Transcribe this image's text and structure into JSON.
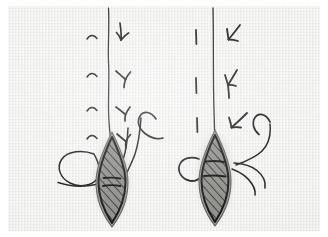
{
  "document": {
    "kind": "scanned-hand-drawn-diagram",
    "medium": "ink on textured paper",
    "paper_color": "#ececeb",
    "ink_color": "#1d1d1d",
    "scan_margin_color": "#ffffff",
    "caption": "",
    "title": "",
    "labels": []
  },
  "figures": [
    {
      "id": "figure-left",
      "name": "left-specimen",
      "label": "",
      "axis": {
        "name": "central-stem-line",
        "description": "long wavy vertical ink line running from top edge down into the hatched body"
      },
      "tick_marks": {
        "left_side": {
          "glyph": "small-arc",
          "count": 4,
          "description": "four small concave-up arc strokes to the left of the stem"
        },
        "right_side": {
          "glyph": "barbed-arrow-down",
          "count": 4,
          "description": "four short down-pointing barbed arrow strokes to the right of the stem"
        }
      },
      "body": {
        "name": "hatched-lens-body",
        "shape": "lens / pod outline",
        "fill": "diagonal-hatching",
        "outline": "dark-ink-double-outline",
        "internal_marks": 2,
        "internal_mark_description": "two short horizontal cross-bars in the upper third of the body"
      },
      "appendages": [
        {
          "name": "teardrop-loop-left",
          "side": "left",
          "description": "large open teardrop loop attached to the left of the body with a tail running right"
        },
        {
          "name": "hook-cane-right",
          "side": "right",
          "description": "tall cane-shaped hook curving over at the top, stem descending to the body"
        },
        {
          "name": "short-stem-right",
          "side": "right",
          "description": "shorter vertical stroke descending to the body beside the cane"
        }
      ]
    },
    {
      "id": "figure-right",
      "name": "right-specimen",
      "label": "",
      "axis": {
        "name": "central-stem-line",
        "description": "straight vertical ink line running from top edge down into the hatched body"
      },
      "tick_marks": {
        "left_side": {
          "glyph": "short-vertical-dash",
          "count": 3,
          "description": "three short vertical dashes to the left of the stem"
        },
        "right_side": {
          "glyph": "barbed-arrow-down-left",
          "count": 3,
          "description": "three down-left pointing barbed arrowheads to the right of the stem"
        }
      },
      "body": {
        "name": "hatched-lens-body",
        "shape": "lens / pod outline",
        "fill": "diagonal-hatching",
        "outline": "dark-ink-double-outline",
        "internal_marks": 2,
        "internal_mark_description": "two horizontal cross-bars in the upper third of the body"
      },
      "appendages": [
        {
          "name": "small-loop-left",
          "side": "left",
          "description": "small closed loop attached at the left shoulder of the body"
        },
        {
          "name": "hook-cane-right",
          "side": "right",
          "description": "small hook curling over at the top right with a long curve sweeping down-left to the body"
        },
        {
          "name": "tendril-right",
          "side": "right",
          "description": "wavy tendril curving out to the right from the body shoulder"
        }
      ]
    }
  ],
  "colors": {
    "ink": "#1d1d1d",
    "ink_soft": "#3a3a3a",
    "hatch": "#5a5a58",
    "body_shadow": "#7d7d7a",
    "paper": "#ececeb",
    "paper_dark": "#d8d8d6",
    "margin": "#ffffff"
  }
}
